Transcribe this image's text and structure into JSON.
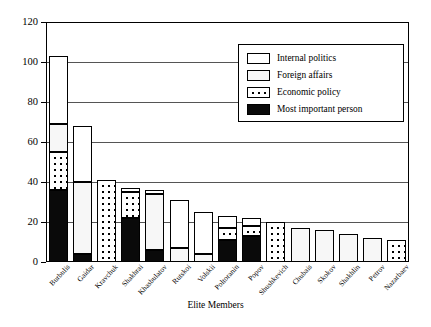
{
  "chart_data": {
    "type": "bar",
    "subtype": "stacked-vertical",
    "title": "",
    "xlabel": "Elite Members",
    "ylabel": "",
    "ylim": [
      0,
      120
    ],
    "yticks": [
      0,
      20,
      40,
      60,
      80,
      100,
      120
    ],
    "grid": true,
    "legend_position": "upper right",
    "categories": [
      "Burbulis",
      "Gaidar",
      "Kravchuk",
      "Shakhrai",
      "Khasbulatov",
      "Rutskoi",
      "Volskii",
      "Poltoranin",
      "Popov",
      "Shushkevich",
      "Chubais",
      "Skokov",
      "Shakhlin",
      "Petrov",
      "Nazarbaev"
    ],
    "series": [
      {
        "name": "Most important person",
        "fill": "solid-black",
        "values": [
          36,
          4,
          0,
          22,
          6,
          0,
          0,
          11,
          13,
          0,
          0,
          0,
          0,
          0,
          0
        ]
      },
      {
        "name": "Economic policy",
        "fill": "coarse-dots",
        "values": [
          19,
          0,
          41,
          13,
          0,
          0,
          0,
          6,
          5,
          20,
          0,
          0,
          0,
          0,
          11
        ]
      },
      {
        "name": "Foreign affairs",
        "fill": "fine-dots",
        "values": [
          14,
          36,
          0,
          0,
          28,
          7,
          4,
          0,
          0,
          0,
          17,
          16,
          14,
          12,
          0
        ]
      },
      {
        "name": "Internal politics",
        "fill": "white",
        "values": [
          34,
          28,
          0,
          2,
          2,
          24,
          21,
          6,
          4,
          0,
          0,
          0,
          0,
          0,
          0
        ]
      }
    ],
    "totals": [
      103,
      68,
      41,
      37,
      36,
      31,
      25,
      23,
      22,
      20,
      17,
      16,
      14,
      12,
      11
    ]
  },
  "legend": {
    "items": [
      {
        "label": "Internal politics"
      },
      {
        "label": "Foreign affairs"
      },
      {
        "label": "Economic policy"
      },
      {
        "label": "Most important person"
      }
    ]
  },
  "colors": {
    "axis": "#000000",
    "gridline": "#555555",
    "person": "#0a0a0a",
    "background": "#ffffff"
  }
}
